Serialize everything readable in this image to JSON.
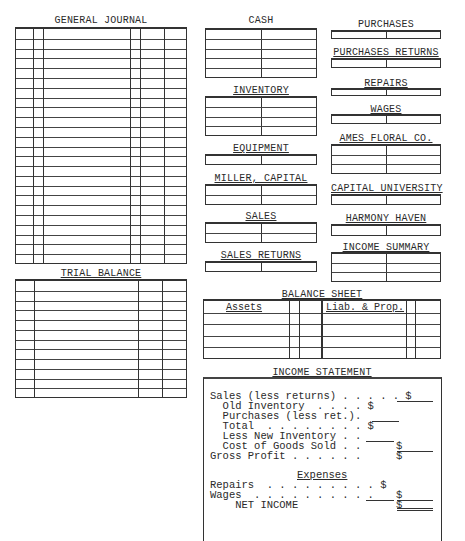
{
  "general_journal": {
    "title": "GENERAL JOURNAL",
    "row_count": 24,
    "columns": [
      "date-month",
      "date-day",
      "account-title",
      "post-ref",
      "debit",
      "credit"
    ]
  },
  "trial_balance": {
    "title": "TRIAL BALANCE",
    "row_count": 12,
    "columns": [
      "account-no",
      "account-title",
      "debit",
      "credit"
    ]
  },
  "t_accounts": [
    {
      "name": "CASH",
      "rows": 5
    },
    {
      "name": "INVENTORY",
      "rows": 4
    },
    {
      "name": "EQUIPMENT",
      "rows": 1
    },
    {
      "name": "MILLER, CAPITAL",
      "rows": 2
    },
    {
      "name": "SALES",
      "rows": 2
    },
    {
      "name": "SALES RETURNS",
      "rows": 1
    },
    {
      "name": "PURCHASES",
      "rows": 1
    },
    {
      "name": "PURCHASES RETURNS",
      "rows": 1
    },
    {
      "name": "REPAIRS",
      "rows": 1
    },
    {
      "name": "WAGES",
      "rows": 1
    },
    {
      "name": "AMES FLORAL CO.",
      "rows": 3
    },
    {
      "name": "CAPITAL UNIVERSITY",
      "rows": 1
    },
    {
      "name": "HARMONY HAVEN",
      "rows": 1
    },
    {
      "name": "INCOME SUMMARY",
      "rows": 3
    }
  ],
  "balance_sheet": {
    "title": "BALANCE SHEET",
    "assets_label": "Assets",
    "liab_label": "Liab. & Prop.",
    "row_count": 5
  },
  "income_statement": {
    "title": "INCOME STATEMENT",
    "lines": {
      "sales": "Sales (less returns) . . . . . $",
      "old_inventory": "  Old Inventory  . . . . $",
      "purchases": "  Purchases (less ret.).",
      "total": "  Total  . . . . . . . . $",
      "less_new_inventory": "  Less New Inventory . .",
      "cogs": "  Cost of Goods Sold . .",
      "cogs_dollar": "$",
      "gross_profit": "Gross Profit . . . . . .",
      "gross_profit_dollar": "$",
      "expenses_heading": "Expenses",
      "repairs": "Repairs  . . . . . . . . . $",
      "wages": "Wages  . . . . . . . . . .",
      "wages_dollar": "$",
      "net_income": "    NET INCOME",
      "net_income_dollar": "$"
    }
  }
}
